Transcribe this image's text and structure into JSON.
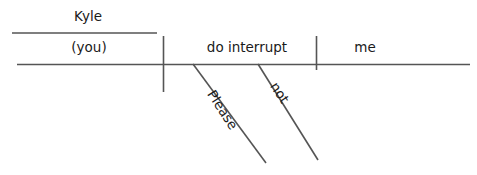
{
  "diagram": {
    "type": "sentence-diagram",
    "canvas": {
      "width": 477,
      "height": 175,
      "background": "#ffffff"
    },
    "line_color": "#555555",
    "text_color": "#1a1a1a",
    "labels": {
      "subject_modifier": "Kyle",
      "subject": "(you)",
      "predicate": "do interrupt",
      "object": "me",
      "modifier_one": "Please",
      "modifier_two": "not"
    },
    "parts": [
      {
        "name": "appositive-line",
        "role": "line",
        "x1": 12,
        "y1": 33,
        "x2": 157,
        "y2": 33
      },
      {
        "name": "baseline",
        "role": "line",
        "x1": 17,
        "y1": 64,
        "x2": 470,
        "y2": 64
      },
      {
        "name": "subject-predicate-divider",
        "role": "line",
        "x1": 163,
        "y1": 36,
        "x2": 163,
        "y2": 92
      },
      {
        "name": "verb-object-divider",
        "role": "line",
        "x1": 316,
        "y1": 36,
        "x2": 316,
        "y2": 70
      },
      {
        "name": "modifier-slant-one",
        "role": "line",
        "x1": 193,
        "y1": 64,
        "x2": 266,
        "y2": 163
      },
      {
        "name": "modifier-slant-two",
        "role": "line",
        "x1": 258,
        "y1": 64,
        "x2": 318,
        "y2": 160
      }
    ]
  }
}
